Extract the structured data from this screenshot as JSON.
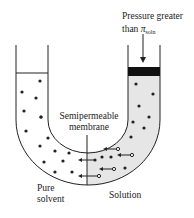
{
  "diagram": {
    "labels": {
      "pressure_line1": "Pressure greater",
      "pressure_line2_prefix": "than ",
      "pi_symbol": "π",
      "pi_subscript": "soln",
      "membrane_line1": "Semipermeable",
      "membrane_line2": "membrane",
      "pure_line1": "Pure",
      "pure_line2": "solvent",
      "solution": "Solution"
    },
    "colors": {
      "line": "#222222",
      "solution_fill": "#e6e6e6",
      "solvent_fill": "#ffffff",
      "piston": "#111111"
    },
    "regions": [
      {
        "name": "pure-solvent-side",
        "solute_particles": 0
      },
      {
        "name": "solution-side",
        "solute_particles": true
      }
    ],
    "arrows": {
      "applied_pressure": "down",
      "solvent_flow": "right-to-left",
      "count": 6
    }
  }
}
